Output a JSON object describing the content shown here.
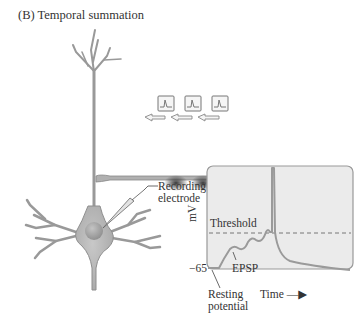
{
  "title": "(B)  Temporal summation",
  "labels": {
    "recording_electrode_line1": "Recording",
    "recording_electrode_line2": "electrode",
    "y_axis": "mV",
    "threshold": "Threshold",
    "epsp": "EPSP",
    "resting_value": "−65",
    "resting_line1": "Resting",
    "resting_line2": "potential",
    "time": "Time —▶"
  },
  "colors": {
    "neuron_fill": "#b4b4b4",
    "neuron_stroke": "#8e8e8e",
    "graph_bg": "#ebebeb",
    "trace": "#9a9a9a",
    "text": "#333333"
  },
  "stimuli": [
    {
      "index": 1,
      "kind": "action-potential-icon"
    },
    {
      "index": 2,
      "kind": "action-potential-icon"
    },
    {
      "index": 3,
      "kind": "action-potential-icon"
    }
  ]
}
